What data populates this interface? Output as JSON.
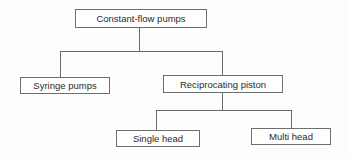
{
  "diagram": {
    "type": "tree",
    "root": {
      "label": "Constant-flow pumps",
      "children": [
        {
          "label": "Syringe pumps",
          "children": []
        },
        {
          "label": "Reciprocating piston",
          "children": [
            {
              "label": "Single head",
              "children": []
            },
            {
              "label": "Multi head",
              "children": []
            }
          ]
        }
      ]
    },
    "nodes": {
      "root": "Constant-flow pumps",
      "syringe": "Syringe pumps",
      "reciprocating": "Reciprocating piston",
      "single": "Single head",
      "multi": "Multi head"
    },
    "colors": {
      "line": "#6a6a6a",
      "box_border": "#6e6e6e",
      "text": "#2a2a2a",
      "background": "#ffffff"
    }
  }
}
